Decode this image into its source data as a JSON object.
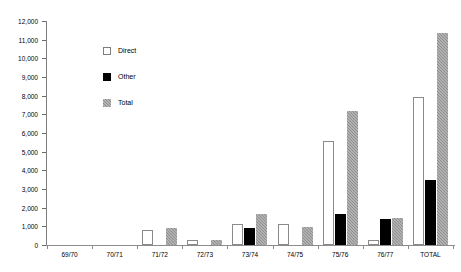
{
  "chart_data": {
    "type": "bar",
    "title": "",
    "subtitle": "",
    "xlabel": "",
    "ylabel": "",
    "grid": false,
    "legend_position": "inside-top-left",
    "categories": [
      "69/70",
      "70/71",
      "71/72",
      "72/73",
      "73/74",
      "74/75",
      "75/76",
      "76/77",
      "TOTAL"
    ],
    "ylim": [
      0,
      12000
    ],
    "ytick_step": 1000,
    "ytick_labels": [
      "0",
      "1,000",
      "2,000",
      "3,000",
      "4,000",
      "5,000",
      "6,000",
      "7,000",
      "8,000",
      "9,000",
      "10,000",
      "11,000",
      "12,000"
    ],
    "ytick_values": [
      0,
      1000,
      2000,
      3000,
      4000,
      5000,
      6000,
      7000,
      8000,
      9000,
      10000,
      11000,
      12000
    ],
    "series": [
      {
        "name": "Direct",
        "color": "#ffffff",
        "values": [
          0,
          0,
          800,
          250,
          1120,
          1120,
          5570,
          280,
          7950
        ]
      },
      {
        "name": "Other",
        "color": "#000000",
        "values": [
          0,
          0,
          0,
          0,
          900,
          0,
          1670,
          1400,
          3490
        ]
      },
      {
        "name": "Total",
        "color": "#8f8f8f",
        "values": [
          0,
          0,
          900,
          250,
          1660,
          970,
          7180,
          1450,
          11350
        ]
      }
    ]
  },
  "legend": {
    "items": [
      {
        "label": "Direct",
        "swatch": "direct"
      },
      {
        "label": "Other",
        "swatch": "other"
      },
      {
        "label": "Total",
        "swatch": "total"
      }
    ]
  }
}
